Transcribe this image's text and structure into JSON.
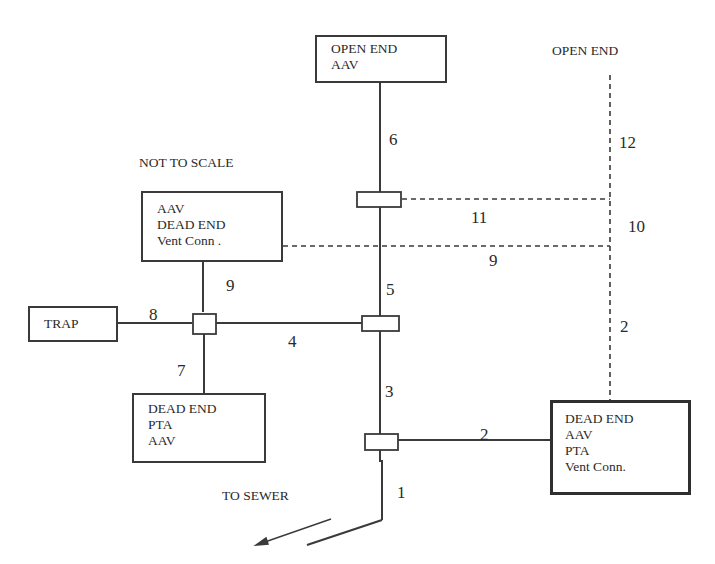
{
  "title_note": "NOT TO  SCALE",
  "labels": {
    "open_end_right": "OPEN END",
    "to_sewer": "TO SEWER"
  },
  "boxes": {
    "top_open_end": {
      "lines": [
        "OPEN END",
        "AAV"
      ]
    },
    "left_vent": {
      "lines": [
        "AAV",
        "DEAD END",
        "Vent Conn   ."
      ]
    },
    "trap": {
      "lines": [
        "TRAP"
      ]
    },
    "bottom_dead_end": {
      "lines": [
        "DEAD END",
        "PTA",
        "AAV"
      ]
    },
    "right_dead_end": {
      "lines": [
        "DEAD END",
        "AAV",
        "PTA",
        "Vent Conn."
      ]
    }
  },
  "segment_numbers": {
    "s1": "1",
    "s2_horizontal": "2",
    "s2_vertical": "2",
    "s3": "3",
    "s4": "4",
    "s5": "5",
    "s6": "6",
    "s7": "7",
    "s8": "8",
    "s9_vertical": "9",
    "s9_dashed": "9",
    "s10": "10",
    "s11": "11",
    "s12": "12"
  },
  "colors": {
    "line": "#3a3a3a",
    "background": "#ffffff"
  }
}
